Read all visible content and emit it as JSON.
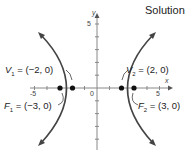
{
  "title": "Solution",
  "axes": {
    "x_label": "x",
    "y_label": "y",
    "x_ticks": [
      "-5",
      "0",
      "5"
    ],
    "y_ticks": [
      "5"
    ]
  },
  "points": {
    "V1": {
      "name": "V",
      "sub": "1",
      "text": " = (−2, 0)"
    },
    "V2": {
      "name": "V",
      "sub": "2",
      "text": " = (2, 0)"
    },
    "F1": {
      "name": "F",
      "sub": "1",
      "text": " = (−3, 0)"
    },
    "F2": {
      "name": "F",
      "sub": "2",
      "text": " = (3, 0)"
    }
  },
  "colors": {
    "curve": "#444444",
    "axis": "#777777"
  }
}
